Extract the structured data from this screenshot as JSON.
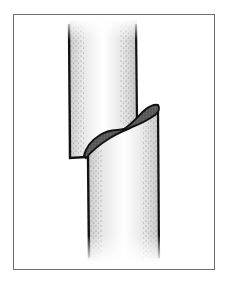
{
  "figure": {
    "caption": "Stem with a slanting cut showing wound",
    "colors": {
      "frame": "#6e6e6e",
      "outline": "#111111",
      "wound_fill": "#5a5a5a",
      "stipple": "#8a8a8a",
      "background": "#ffffff"
    }
  }
}
